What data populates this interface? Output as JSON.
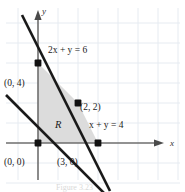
{
  "figure": {
    "type": "linear-programming-feasible-region",
    "caption": "Figure 3.23",
    "axes": {
      "x_label": "x",
      "y_label": "y",
      "x_axis_y_pixel": 143,
      "y_axis_x_pixel": 38,
      "grid_spacing_px": 20,
      "grid_visible": true,
      "grid_color": "#e4eaf0",
      "axis_color": "#6e6e6e"
    },
    "lines": [
      {
        "name": "line-2x-plus-y-equals-6",
        "label": "2x + y = 6",
        "equation": "2x + y = 6",
        "slope": -2,
        "intercepts": {
          "x": 3,
          "y": 6
        },
        "color": "#1a1a1a",
        "label_x_px": 48,
        "label_y_px": 50
      },
      {
        "name": "line-x-plus-y-equals-4",
        "label": "x + y = 4",
        "equation": "x + y = 4",
        "slope": -1,
        "intercepts": {
          "x": 4,
          "y": 4
        },
        "color": "#1a1a1a",
        "label_x_px": 89,
        "label_y_px": 125
      }
    ],
    "region": {
      "name": "R",
      "label": "R",
      "fill_color": "#dcdcdc",
      "vertices": [
        {
          "label": "(0, 0)",
          "x": 0,
          "y": 0
        },
        {
          "label": "(0, 4)",
          "x": 0,
          "y": 4
        },
        {
          "label": "(2, 2)",
          "x": 2,
          "y": 2
        },
        {
          "label": "(3, 0)",
          "x": 3,
          "y": 0
        }
      ],
      "label_x_px": 58,
      "label_y_px": 124
    },
    "points": [
      {
        "name": "point-0-4",
        "label": "(0, 4)",
        "x": 0,
        "y": 4,
        "label_x_px": 5,
        "label_y_px": 84
      },
      {
        "name": "point-2-2",
        "label": "(2, 2)",
        "x": 2,
        "y": 2,
        "label_x_px": 80,
        "label_y_px": 107
      },
      {
        "name": "point-0-0",
        "label": "(0, 0)",
        "x": 0,
        "y": 0,
        "label_x_px": 5,
        "label_y_px": 163
      },
      {
        "name": "point-3-0",
        "label": "(3, 0)",
        "x": 3,
        "y": 0,
        "label_x_px": 57,
        "label_y_px": 163
      }
    ]
  }
}
